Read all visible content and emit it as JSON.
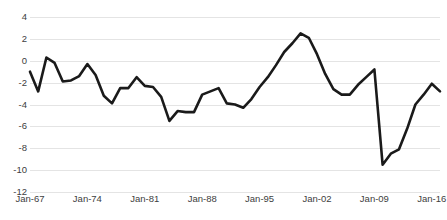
{
  "chart_data": {
    "type": "line",
    "title": "",
    "subtitle": "",
    "xlabel": "",
    "ylabel": "",
    "grid": true,
    "legend": false,
    "legend_position": "none",
    "line_color": "#1a1a1a",
    "gridline_color": "#e4e4e4",
    "background_color": "#ffffff",
    "ylim": [
      -12,
      4
    ],
    "ytick_step": 2,
    "ytick_labels": [
      "4",
      "2",
      "0",
      "-2",
      "-4",
      "-6",
      "-8",
      "-10",
      "-12"
    ],
    "ytick_values": [
      4,
      2,
      0,
      -2,
      -4,
      -6,
      -8,
      -10,
      -12
    ],
    "xtick_labels": [
      "Jan-67",
      "Jan-74",
      "Jan-81",
      "Jan-88",
      "Jan-95",
      "Jan-02",
      "Jan-09",
      "Jan-16"
    ],
    "xtick_values": [
      1967,
      1974,
      1981,
      1988,
      1995,
      2002,
      2009,
      2016
    ],
    "xlim": [
      1967,
      2017
    ],
    "series": [
      {
        "name": "series-1",
        "x": [
          1967,
          1968,
          1969,
          1970,
          1971,
          1972,
          1973,
          1974,
          1975,
          1976,
          1977,
          1978,
          1979,
          1980,
          1981,
          1982,
          1983,
          1984,
          1985,
          1986,
          1987,
          1988,
          1989,
          1990,
          1991,
          1992,
          1993,
          1994,
          1995,
          1996,
          1997,
          1998,
          1999,
          2000,
          2001,
          2002,
          2003,
          2004,
          2005,
          2006,
          2007,
          2008,
          2009,
          2010,
          2011,
          2012,
          2013,
          2014,
          2015,
          2016,
          2017
        ],
        "values": [
          -1.0,
          -2.8,
          0.3,
          -0.2,
          -1.9,
          -1.8,
          -1.4,
          -0.3,
          -1.3,
          -3.2,
          -3.9,
          -2.5,
          -2.5,
          -1.5,
          -2.3,
          -2.4,
          -3.3,
          -5.5,
          -4.6,
          -4.7,
          -4.7,
          -3.1,
          -2.8,
          -2.5,
          -3.9,
          -4.0,
          -4.3,
          -3.5,
          -2.4,
          -1.5,
          -0.4,
          0.8,
          1.6,
          2.5,
          2.1,
          0.6,
          -1.2,
          -2.6,
          -3.1,
          -3.1,
          -2.2,
          -1.5,
          -0.8,
          -9.5,
          -8.5,
          -8.1,
          -6.2,
          -4.0,
          -3.1,
          -2.1,
          -2.8
        ]
      }
    ]
  }
}
